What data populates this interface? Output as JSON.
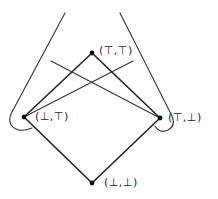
{
  "diagram": {
    "type": "lattice-hasse-diagram",
    "nodes": [
      {
        "id": "top",
        "label": "(⊤,⊤)",
        "x": 92,
        "y": 53
      },
      {
        "id": "left",
        "label": "(⊥,⊤)",
        "x": 24,
        "y": 117
      },
      {
        "id": "right",
        "label": "(⊤,⊥)",
        "x": 160,
        "y": 118
      },
      {
        "id": "bottom",
        "label": "(⊥,⊥)",
        "x": 92,
        "y": 183
      }
    ],
    "edges": [
      [
        "bottom",
        "left"
      ],
      [
        "bottom",
        "right"
      ],
      [
        "left",
        "top"
      ],
      [
        "right",
        "top"
      ]
    ],
    "colors": {
      "stroke": "#222222",
      "background": "#ffffff"
    }
  }
}
